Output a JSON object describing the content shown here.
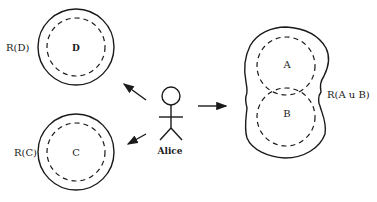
{
  "diagram": {
    "actor": {
      "name": "Alice"
    },
    "regions": [
      {
        "id": "D",
        "inner_label": "D",
        "outer_label": "R(D)"
      },
      {
        "id": "C",
        "inner_label": "C",
        "outer_label": "R(C)"
      },
      {
        "id": "AuB",
        "inner_labels": [
          "A",
          "B"
        ],
        "outer_label": "R(A u B)"
      }
    ],
    "arrows": [
      {
        "from": "Alice",
        "to": "R(D)"
      },
      {
        "from": "Alice",
        "to": "R(C)"
      },
      {
        "from": "Alice",
        "to": "R(A u B)"
      }
    ],
    "colors": {
      "ink": "#1a1a1a",
      "background": "#ffffff"
    }
  }
}
